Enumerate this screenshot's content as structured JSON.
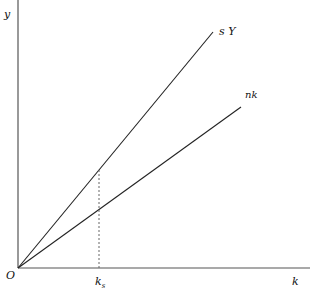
{
  "diagram": {
    "type": "solow-growth-model",
    "axes": {
      "y_label": "y",
      "x_label": "k",
      "origin_label": "O"
    },
    "lines": [
      {
        "name": "savings-curve",
        "label": "s Y",
        "from": [
          18,
          268
        ],
        "to": [
          213,
          32
        ]
      },
      {
        "name": "break-even-line",
        "label": "nk",
        "from": [
          18,
          268
        ],
        "to": [
          241,
          107
        ]
      }
    ],
    "marker": {
      "label": "k",
      "subscript": "s",
      "x": 99,
      "dashed_top_y": 170
    },
    "colors": {
      "axis": "#555555",
      "line": "#222222",
      "dashed": "#666666"
    }
  }
}
